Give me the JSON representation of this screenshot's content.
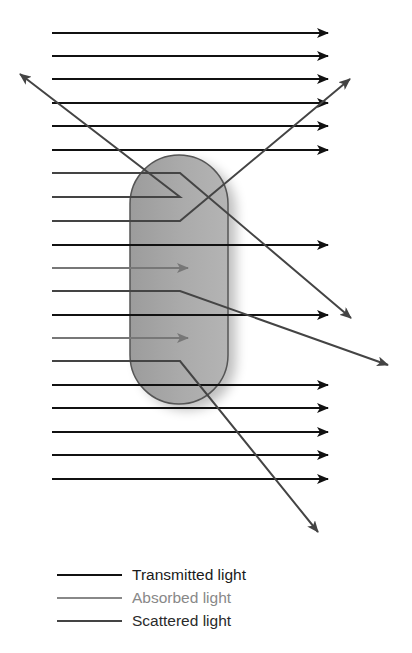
{
  "figure": {
    "type": "light-interaction-diagram",
    "colors": {
      "transmitted": "#111111",
      "absorbed": "#777777",
      "scattered": "#444444",
      "particle_fill": "#a8a8a8",
      "particle_stroke": "#555555"
    },
    "particle": {
      "x": 130,
      "y": 155,
      "width": 98,
      "height": 249
    },
    "rays": [
      {
        "type": "transmitted",
        "y": 33
      },
      {
        "type": "transmitted",
        "y": 56
      },
      {
        "type": "transmitted",
        "y": 79
      },
      {
        "type": "transmitted",
        "y": 103
      },
      {
        "type": "transmitted",
        "y": 126
      },
      {
        "type": "transmitted",
        "y": 150
      },
      {
        "type": "scattered",
        "y": 173,
        "bend_x": 180,
        "end": [
          351,
          318
        ]
      },
      {
        "type": "scattered",
        "y": 197,
        "bend_x": 180,
        "end": [
          20,
          74
        ]
      },
      {
        "type": "scattered",
        "y": 221,
        "bend_x": 180,
        "end": [
          350,
          79
        ]
      },
      {
        "type": "transmitted",
        "y": 245
      },
      {
        "type": "absorbed",
        "y": 268,
        "end_x": 188
      },
      {
        "type": "scattered",
        "y": 291,
        "bend_x": 180,
        "end": [
          388,
          365
        ]
      },
      {
        "type": "transmitted",
        "y": 315
      },
      {
        "type": "absorbed",
        "y": 338,
        "end_x": 188
      },
      {
        "type": "scattered",
        "y": 361,
        "bend_x": 180,
        "end": [
          318,
          532
        ]
      },
      {
        "type": "transmitted",
        "y": 385
      },
      {
        "type": "transmitted",
        "y": 408
      },
      {
        "type": "transmitted",
        "y": 432
      },
      {
        "type": "transmitted",
        "y": 455
      },
      {
        "type": "transmitted",
        "y": 479
      }
    ]
  },
  "legend": {
    "items": [
      {
        "key": "transmitted",
        "label": "Transmitted light"
      },
      {
        "key": "absorbed",
        "label": "Absorbed light"
      },
      {
        "key": "scattered",
        "label": "Scattered light"
      }
    ]
  }
}
